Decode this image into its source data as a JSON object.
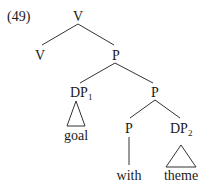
{
  "example_number": "(49)",
  "nodes": {
    "root": {
      "label": "V"
    },
    "v_left": {
      "label": "V"
    },
    "p1": {
      "label": "P"
    },
    "dp1": {
      "label": "DP",
      "subscript": "1"
    },
    "p2": {
      "label": "P"
    },
    "p3": {
      "label": "P"
    },
    "dp2": {
      "label": "DP",
      "subscript": "2"
    }
  },
  "leaves": {
    "goal": "goal",
    "with": "with",
    "theme": "theme"
  },
  "colors": {
    "text": "#1a1a1a",
    "line": "#333333",
    "background": "#ffffff"
  }
}
